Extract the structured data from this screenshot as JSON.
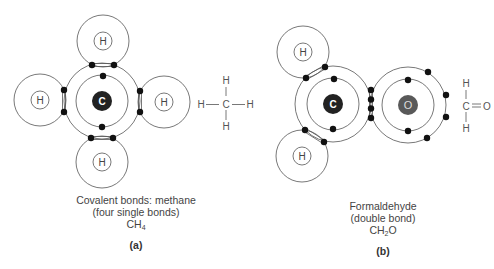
{
  "panels": [
    {
      "id": "a",
      "label": "(a)",
      "caption": {
        "line1": "Covalent bonds: methane",
        "line2": "(four single bonds)",
        "formula_main": "CH",
        "formula_sub": "4"
      },
      "central_atom": "C",
      "hydrogen_label": "H",
      "structural_formula": {
        "top": "H",
        "left": "H",
        "center": "C",
        "right": "H",
        "bottom": "H"
      }
    },
    {
      "id": "b",
      "label": "(b)",
      "caption": {
        "line1": "Formaldehyde",
        "line2": "(double bond)",
        "formula_main": "CH",
        "formula_sub": "2",
        "formula_tail": "O"
      },
      "central_atom": "C",
      "second_atom": "O",
      "hydrogen_label": "H",
      "structural_formula": {
        "top": "H",
        "center": "C",
        "right": "O",
        "bottom": "H"
      }
    }
  ],
  "colors": {
    "carbon_nucleus": "#222222",
    "oxygen_nucleus": "#595959",
    "electron": "#111111",
    "shell_stroke": "#555555"
  }
}
